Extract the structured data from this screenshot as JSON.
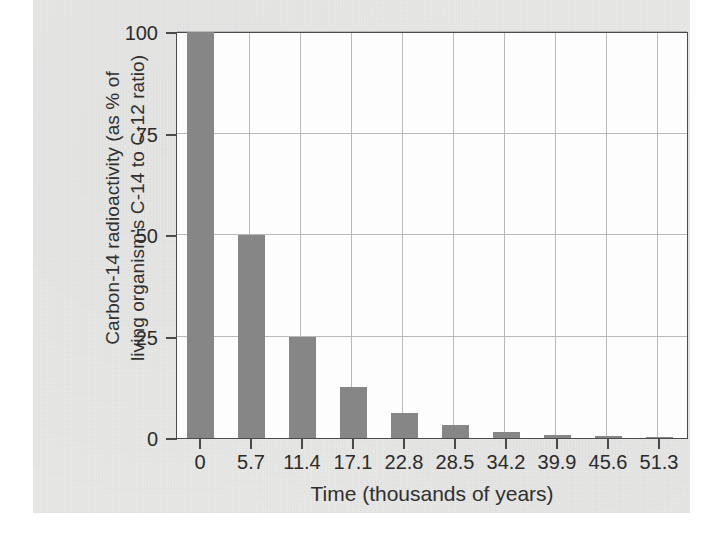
{
  "chart_data": {
    "type": "bar",
    "title": "",
    "xlabel": "Time (thousands of years)",
    "ylabel": "Carbon-14 radioactivity (as % of\nliving organism's C-14 to C-12 ratio)",
    "ylabel_line1": "Carbon-14 radioactivity (as % of",
    "ylabel_line2": "living organism's C-14 to C-12 ratio)",
    "categories": [
      "0",
      "5.7",
      "11.4",
      "17.1",
      "22.8",
      "28.5",
      "34.2",
      "39.9",
      "45.6",
      "51.3"
    ],
    "values": [
      100,
      50,
      25,
      12.5,
      6.25,
      3.1,
      1.6,
      0.8,
      0.4,
      0.2
    ],
    "ylim": [
      0,
      100
    ],
    "yticks": [
      "0",
      "25",
      "50",
      "75",
      "100"
    ],
    "ytick_values": [
      0,
      25,
      50,
      75,
      100
    ],
    "xlim": [
      0,
      51.3
    ],
    "grid": "both",
    "legend": "none",
    "bar_color": "#868686",
    "grid_color": "#b9b9b9",
    "frame_color": "#4a4a4a",
    "background_color": "#e9e9e7",
    "plot_background_color": "#fdfdfd"
  }
}
